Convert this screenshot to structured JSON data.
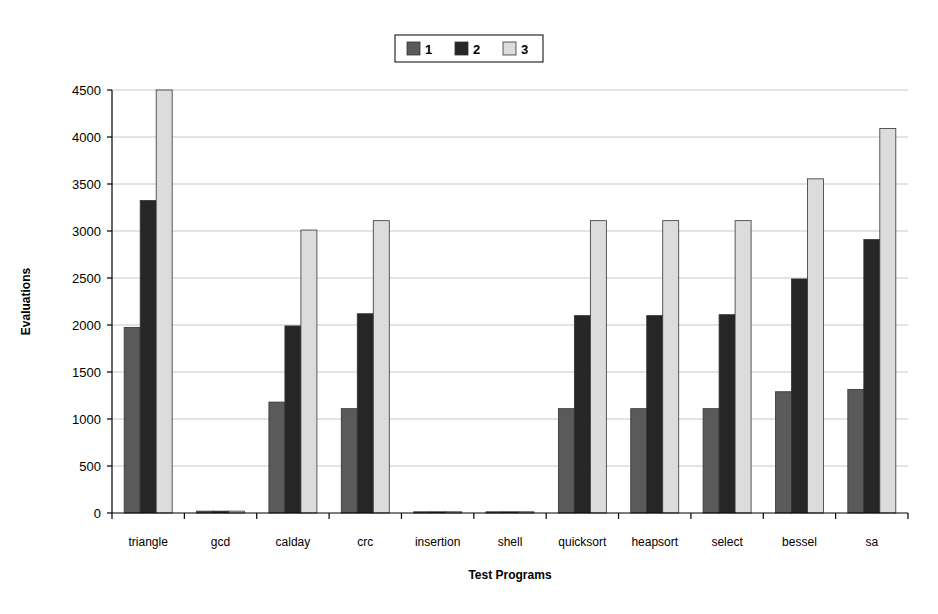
{
  "chart_data": {
    "type": "bar",
    "title": "",
    "xlabel": "Test Programs",
    "ylabel": "Evaluations",
    "ylim": [
      0,
      4500
    ],
    "ytick_step": 500,
    "yticks": [
      0,
      500,
      1000,
      1500,
      2000,
      2500,
      3000,
      3500,
      4000,
      4500
    ],
    "ytick_labels": [
      "0",
      "500",
      "1000",
      "1500",
      "2000",
      "2500",
      "3000",
      "3500",
      "4000",
      "4500"
    ],
    "grid": true,
    "legend_position": "top-center",
    "categories": [
      "triangle",
      "gcd",
      "calday",
      "crc",
      "insertion",
      "shell",
      "quicksort",
      "heapsort",
      "select",
      "bessel",
      "sa"
    ],
    "series": [
      {
        "name": "1",
        "color": "#5a5a5a",
        "values": [
          1975,
          20,
          1180,
          1110,
          12,
          10,
          1110,
          1110,
          1110,
          1290,
          1315
        ]
      },
      {
        "name": "2",
        "color": "#262626",
        "values": [
          3325,
          20,
          1990,
          2120,
          12,
          10,
          2100,
          2100,
          2110,
          2490,
          2910
        ]
      },
      {
        "name": "3",
        "color": "#dcdcdc",
        "values": [
          4500,
          20,
          3010,
          3110,
          12,
          10,
          3110,
          3110,
          3110,
          3555,
          4090
        ]
      }
    ]
  },
  "legend": {
    "entries": [
      {
        "label": "1",
        "color": "#5a5a5a"
      },
      {
        "label": "2",
        "color": "#262626"
      },
      {
        "label": "3",
        "color": "#dcdcdc"
      }
    ]
  },
  "colors": {
    "series_1": "#5a5a5a",
    "series_2": "#262626",
    "series_3": "#dcdcdc",
    "gridline": "#c8c8c8",
    "axis": "#000000",
    "background": "#ffffff"
  }
}
